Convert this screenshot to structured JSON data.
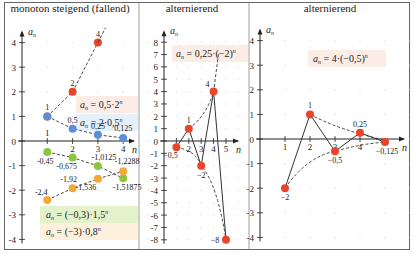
{
  "panels": [
    {
      "title": "monoton steigend (fallend)",
      "ylabel": "a_n",
      "xlabel": "n"
    },
    {
      "title": "alternierend",
      "ylabel": "a_n",
      "xlabel": "n"
    },
    {
      "title": "alternierend",
      "ylabel": "a_n",
      "xlabel": "n"
    }
  ],
  "colors": {
    "red": "#e8452a",
    "blue": "#5b8fd6",
    "green": "#8cc63f",
    "orange": "#f5a83a",
    "greenbox": "#e4f2cc",
    "orangebox": "#fdf1de",
    "pinkbox": "#fbece6",
    "bluebox": "#e6f0fa"
  },
  "chart_data": [
    {
      "type": "scatter",
      "title": "monoton steigend (fallend)",
      "xlabel": "n",
      "ylabel": "a_n",
      "xlim": [
        0,
        4.5
      ],
      "ylim": [
        -4,
        4
      ],
      "yticks": [
        -4,
        -3,
        -2,
        -1,
        0,
        1,
        2,
        3,
        4
      ],
      "xticks": [
        1,
        2,
        3,
        4
      ],
      "series": [
        {
          "name": "a_n = 0,5·2^n",
          "x": [
            1,
            2,
            3
          ],
          "values": [
            1,
            2,
            4
          ],
          "labels": [
            "1",
            "2",
            "4"
          ],
          "color": "#e8452a"
        },
        {
          "name": "a_n = 2·0,5^n",
          "x": [
            1,
            2,
            3,
            4
          ],
          "values": [
            1,
            0.5,
            0.25,
            0.125
          ],
          "labels": [
            "1",
            "0,5",
            "0,25",
            "0,125"
          ],
          "color": "#5b8fd6"
        },
        {
          "name": "a_n = (−0,3)·1,5^n",
          "x": [
            1,
            2,
            3,
            4
          ],
          "values": [
            -0.45,
            -0.675,
            -1.0125,
            -1.51875
          ],
          "labels": [
            "-0,45",
            "-0,675",
            "-1,0125",
            "-1,51875"
          ],
          "color": "#8cc63f"
        },
        {
          "name": "a_n = (−3)·0,8^n",
          "x": [
            1,
            2,
            3,
            4
          ],
          "values": [
            -2.4,
            -1.92,
            -1.536,
            -1.2288
          ],
          "labels": [
            "-2,4",
            "-1,92",
            "-1,536",
            "-1,2288"
          ],
          "color": "#f5a83a"
        }
      ]
    },
    {
      "type": "scatter",
      "title": "alternierend",
      "xlabel": "n",
      "ylabel": "a_n",
      "xlim": [
        0,
        5.5
      ],
      "ylim": [
        -8,
        8
      ],
      "yticks": [
        -8,
        -7,
        -6,
        -5,
        -4,
        -3,
        -2,
        -1,
        0,
        1,
        2,
        3,
        4,
        5,
        6,
        7,
        8
      ],
      "xticks": [
        1,
        2,
        3,
        4,
        5
      ],
      "series": [
        {
          "name": "a_n = 0,25·(−2)^n",
          "x": [
            1,
            2,
            3,
            4,
            5
          ],
          "values": [
            -0.5,
            1,
            -2,
            4,
            -8
          ],
          "labels": [
            "-0,5",
            "1",
            "-2",
            "4",
            "-8"
          ],
          "color": "#e8452a"
        }
      ]
    },
    {
      "type": "scatter",
      "title": "alternierend",
      "xlabel": "n",
      "ylabel": "a_n",
      "xlim": [
        0,
        5.5
      ],
      "ylim": [
        -4,
        4
      ],
      "yticks": [
        -4,
        -3,
        -2,
        -1,
        0,
        1,
        2,
        3,
        4
      ],
      "xticks": [
        1,
        2,
        3,
        4
      ],
      "series": [
        {
          "name": "a_n = 4·(−0,5)^n",
          "x": [
            1,
            2,
            3,
            4,
            5
          ],
          "values": [
            -2,
            1,
            -0.5,
            0.25,
            -0.125
          ],
          "labels": [
            "-2",
            "1",
            "-0,5",
            "0,25",
            "-0,125"
          ],
          "color": "#e8452a"
        }
      ]
    }
  ],
  "formulas": {
    "p1_red": "a_n = 0,5·2^n",
    "p1_blue": "a_n = 2·0,5^n",
    "p1_green": "a_n = (−0,3)·1,5^n",
    "p1_orange": "a_n = (−3)·0,8^n",
    "p2": "a_n = 0,25·(−2)^n",
    "p3": "a_n = 4·(−0,5)^n"
  }
}
